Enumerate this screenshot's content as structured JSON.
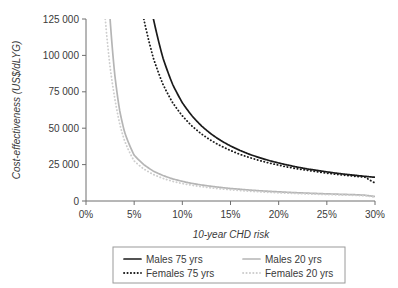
{
  "chart_data": {
    "type": "line",
    "title": "",
    "xlabel": "10-year CHD risk",
    "ylabel": "Cost-effectiveness (US$/dLYG)",
    "xlim": [
      0,
      30
    ],
    "ylim": [
      0,
      125000
    ],
    "grid": false,
    "legend_position": "bottom",
    "x_tick_labels": [
      "0%",
      "5%",
      "10%",
      "15%",
      "20%",
      "25%",
      "30%"
    ],
    "x_ticks": [
      0,
      5,
      10,
      15,
      20,
      25,
      30
    ],
    "y_tick_labels": [
      "0",
      "25 000",
      "50 000",
      "75 000",
      "100 000",
      "125 000"
    ],
    "y_ticks": [
      0,
      25000,
      50000,
      75000,
      100000,
      125000
    ],
    "x": [
      2,
      2.5,
      3,
      3.5,
      4,
      5,
      6,
      7,
      8,
      9,
      10,
      11,
      12,
      13,
      14,
      15,
      16,
      17,
      18,
      19,
      20,
      21,
      22,
      23,
      24,
      25,
      26,
      27,
      28,
      29,
      30
    ],
    "series": [
      {
        "name": "Males 75 yrs",
        "style": "solid",
        "color": "#1a1a1a",
        "x_start": 7.2,
        "values": [
          null,
          null,
          null,
          null,
          null,
          null,
          null,
          125000,
          98000,
          80000,
          67500,
          58500,
          51500,
          46000,
          41500,
          37800,
          34700,
          32000,
          29800,
          27800,
          26100,
          24600,
          23200,
          22000,
          21000,
          20000,
          19100,
          18300,
          17600,
          16900,
          16300
        ]
      },
      {
        "name": "Females 75 yrs",
        "style": "dotted",
        "color": "#1a1a1a",
        "x_start": 6.0,
        "values": [
          null,
          null,
          null,
          null,
          null,
          null,
          125000,
          98000,
          80000,
          67500,
          58500,
          51500,
          46000,
          41500,
          37800,
          34700,
          32000,
          29800,
          27800,
          26100,
          24600,
          23200,
          22000,
          21000,
          20000,
          19100,
          18300,
          17600,
          16900,
          16300,
          12400
        ]
      },
      {
        "name": "Males 20 yrs",
        "style": "solid",
        "color": "#b5b5b5",
        "x_start": 2.4,
        "values": [
          null,
          125000,
          86000,
          62000,
          47500,
          31500,
          25000,
          20500,
          17500,
          15200,
          13500,
          12100,
          11000,
          10100,
          9300,
          8600,
          8050,
          7500,
          7050,
          6650,
          6300,
          5950,
          5650,
          5400,
          5150,
          4900,
          4700,
          4500,
          4300,
          3950,
          3100
        ]
      },
      {
        "name": "Females 20 yrs",
        "style": "dotted",
        "color": "#cecece",
        "x_start": 2.2,
        "values": [
          125000,
          92000,
          70000,
          53000,
          41500,
          27500,
          22000,
          18200,
          15500,
          13500,
          12000,
          10800,
          9800,
          9000,
          8300,
          7700,
          7200,
          6700,
          6300,
          5950,
          5650,
          5350,
          5100,
          4850,
          4650,
          4450,
          4250,
          4050,
          3850,
          3550,
          2700
        ]
      }
    ],
    "legend": [
      {
        "label": "Males 75 yrs",
        "style": "solid",
        "color": "#1a1a1a"
      },
      {
        "label": "Males 20 yrs",
        "style": "solid",
        "color": "#b5b5b5"
      },
      {
        "label": "Females 75 yrs",
        "style": "dotted",
        "color": "#1a1a1a"
      },
      {
        "label": "Females 20 yrs",
        "style": "dotted",
        "color": "#cecece"
      }
    ]
  }
}
